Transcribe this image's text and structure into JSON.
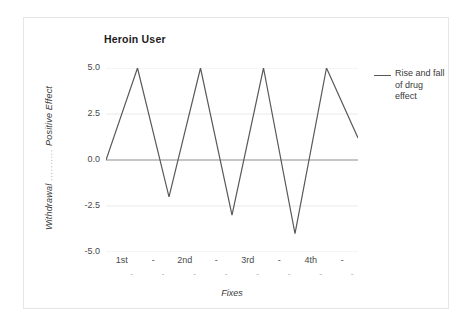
{
  "chart_data": {
    "type": "line",
    "title": "Heroin User",
    "xlabel": "Fixes",
    "ylabel": "Withdrawal ---------- Positive Effect",
    "ylabel_low": "Withdrawal",
    "ylabel_high": "Positive Effect",
    "ylabel_connector": "..........",
    "ylim": [
      -5.0,
      5.0
    ],
    "yticks": [
      "5.0",
      "2.5",
      "0.0",
      "-2.5",
      "-5.0"
    ],
    "ytick_values": [
      5.0,
      2.5,
      0.0,
      -2.5,
      -5.0
    ],
    "xticks": [
      "1st",
      "-",
      "2nd",
      "-",
      "3rd",
      "-",
      "4th",
      "-"
    ],
    "xticks_row2": [
      "-",
      "-",
      "-",
      "-",
      "-",
      "-",
      "-",
      "-"
    ],
    "grid": true,
    "zero_line": true,
    "legend_position": "right",
    "series": [
      {
        "name": "Rise and fall of drug effect",
        "color": "#595959",
        "x": [
          0,
          1,
          2,
          3,
          4,
          5,
          6,
          7,
          8
        ],
        "values": [
          0.0,
          5.0,
          -2.0,
          5.0,
          -3.0,
          5.0,
          -4.0,
          5.0,
          1.2
        ]
      }
    ]
  },
  "legend": {
    "entries": [
      {
        "label": "Rise and fall of drug effect"
      }
    ]
  }
}
